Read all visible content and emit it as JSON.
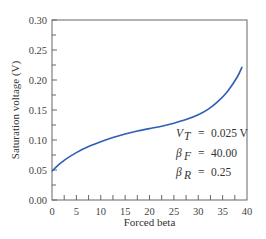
{
  "chart_data": {
    "type": "line",
    "title": "",
    "xlabel": "Forced beta",
    "ylabel": "Saturation voltage (V)",
    "xlim": [
      0,
      40
    ],
    "ylim": [
      0.0,
      0.3
    ],
    "x_ticks": [
      "0",
      "5",
      "10",
      "15",
      "20",
      "25",
      "30",
      "35",
      "40"
    ],
    "y_ticks": [
      "0.00",
      "0.05",
      "0.10",
      "0.15",
      "0.20",
      "0.25",
      "0.30"
    ],
    "grid": false,
    "legend": null,
    "series": [
      {
        "name": "Saturation voltage",
        "color": "#2f5fb3",
        "x": [
          0,
          1,
          2,
          3,
          5,
          7.5,
          10,
          12.5,
          15,
          17.5,
          20,
          22.5,
          25,
          27.5,
          30,
          32,
          34,
          36,
          38,
          39
        ],
        "y": [
          0.048,
          0.056,
          0.063,
          0.069,
          0.079,
          0.089,
          0.097,
          0.104,
          0.11,
          0.115,
          0.119,
          0.123,
          0.128,
          0.134,
          0.142,
          0.151,
          0.164,
          0.181,
          0.205,
          0.222
        ]
      }
    ],
    "annotations": [
      {
        "symbol": "V",
        "sub": "T",
        "value": "0.025 V"
      },
      {
        "symbol": "β",
        "sub": "F",
        "value": "40.00"
      },
      {
        "symbol": "β",
        "sub": "R",
        "value": "0.25"
      }
    ]
  }
}
